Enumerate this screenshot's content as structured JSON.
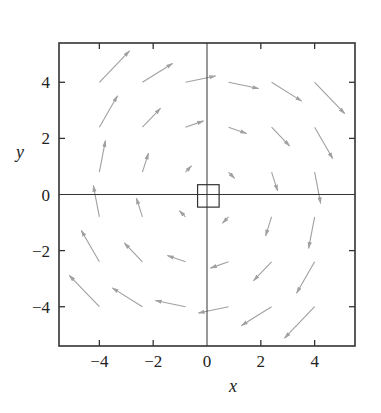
{
  "chart_data": {
    "type": "quiver",
    "title": "",
    "xlabel": "x",
    "ylabel": "y",
    "xlim": [
      -5.5,
      5.5
    ],
    "ylim": [
      -5.4,
      5.4
    ],
    "xticks": [
      -4,
      -2,
      0,
      2,
      4
    ],
    "yticks": [
      -4,
      -2,
      0,
      2,
      4
    ],
    "xtick_labels": [
      "−4",
      "−2",
      "0",
      "2",
      "4"
    ],
    "ytick_labels": [
      "−4",
      "−2",
      "0",
      "2",
      "4"
    ],
    "grid": false,
    "legend": null,
    "field": "F(x, y) = (y, −x)",
    "rotation": "clockwise",
    "grid_points": [
      -4,
      -2.4,
      -0.8,
      0.8,
      2.4,
      4
    ],
    "arrow_scale": 0.28,
    "arrow_color": "#a0a0a0",
    "axis_color": "#333333",
    "origin_box": {
      "x0": -0.35,
      "x1": 0.45,
      "y0": -0.45,
      "y1": 0.35
    },
    "vectors": [
      {
        "x": -4,
        "y": 4,
        "u": 4,
        "v": 4
      },
      {
        "x": -2.4,
        "y": 4,
        "u": 4,
        "v": 2.4
      },
      {
        "x": -0.8,
        "y": 4,
        "u": 4,
        "v": 0.8
      },
      {
        "x": 0.8,
        "y": 4,
        "u": 4,
        "v": -0.8
      },
      {
        "x": 2.4,
        "y": 4,
        "u": 4,
        "v": -2.4
      },
      {
        "x": 4,
        "y": 4,
        "u": 4,
        "v": -4
      },
      {
        "x": -4,
        "y": 2.4,
        "u": 2.4,
        "v": 4
      },
      {
        "x": -2.4,
        "y": 2.4,
        "u": 2.4,
        "v": 2.4
      },
      {
        "x": -0.8,
        "y": 2.4,
        "u": 2.4,
        "v": 0.8
      },
      {
        "x": 0.8,
        "y": 2.4,
        "u": 2.4,
        "v": -0.8
      },
      {
        "x": 2.4,
        "y": 2.4,
        "u": 2.4,
        "v": -2.4
      },
      {
        "x": 4,
        "y": 2.4,
        "u": 2.4,
        "v": -4
      },
      {
        "x": -4,
        "y": 0.8,
        "u": 0.8,
        "v": 4
      },
      {
        "x": -2.4,
        "y": 0.8,
        "u": 0.8,
        "v": 2.4
      },
      {
        "x": -0.8,
        "y": 0.8,
        "u": 0.8,
        "v": 0.8
      },
      {
        "x": 0.8,
        "y": 0.8,
        "u": 0.8,
        "v": -0.8
      },
      {
        "x": 2.4,
        "y": 0.8,
        "u": 0.8,
        "v": -2.4
      },
      {
        "x": 4,
        "y": 0.8,
        "u": 0.8,
        "v": -4
      },
      {
        "x": -4,
        "y": -0.8,
        "u": -0.8,
        "v": 4
      },
      {
        "x": -2.4,
        "y": -0.8,
        "u": -0.8,
        "v": 2.4
      },
      {
        "x": -0.8,
        "y": -0.8,
        "u": -0.8,
        "v": 0.8
      },
      {
        "x": 0.8,
        "y": -0.8,
        "u": -0.8,
        "v": -0.8
      },
      {
        "x": 2.4,
        "y": -0.8,
        "u": -0.8,
        "v": -2.4
      },
      {
        "x": 4,
        "y": -0.8,
        "u": -0.8,
        "v": -4
      },
      {
        "x": -4,
        "y": -2.4,
        "u": -2.4,
        "v": 4
      },
      {
        "x": -2.4,
        "y": -2.4,
        "u": -2.4,
        "v": 2.4
      },
      {
        "x": -0.8,
        "y": -2.4,
        "u": -2.4,
        "v": 0.8
      },
      {
        "x": 0.8,
        "y": -2.4,
        "u": -2.4,
        "v": -0.8
      },
      {
        "x": 2.4,
        "y": -2.4,
        "u": -2.4,
        "v": -2.4
      },
      {
        "x": 4,
        "y": -2.4,
        "u": -2.4,
        "v": -4
      },
      {
        "x": -4,
        "y": -4,
        "u": -4,
        "v": 4
      },
      {
        "x": -2.4,
        "y": -4,
        "u": -4,
        "v": 2.4
      },
      {
        "x": -0.8,
        "y": -4,
        "u": -4,
        "v": 0.8
      },
      {
        "x": 0.8,
        "y": -4,
        "u": -4,
        "v": -0.8
      },
      {
        "x": 2.4,
        "y": -4,
        "u": -4,
        "v": -2.4
      },
      {
        "x": 4,
        "y": -4,
        "u": -4,
        "v": -4
      }
    ]
  }
}
